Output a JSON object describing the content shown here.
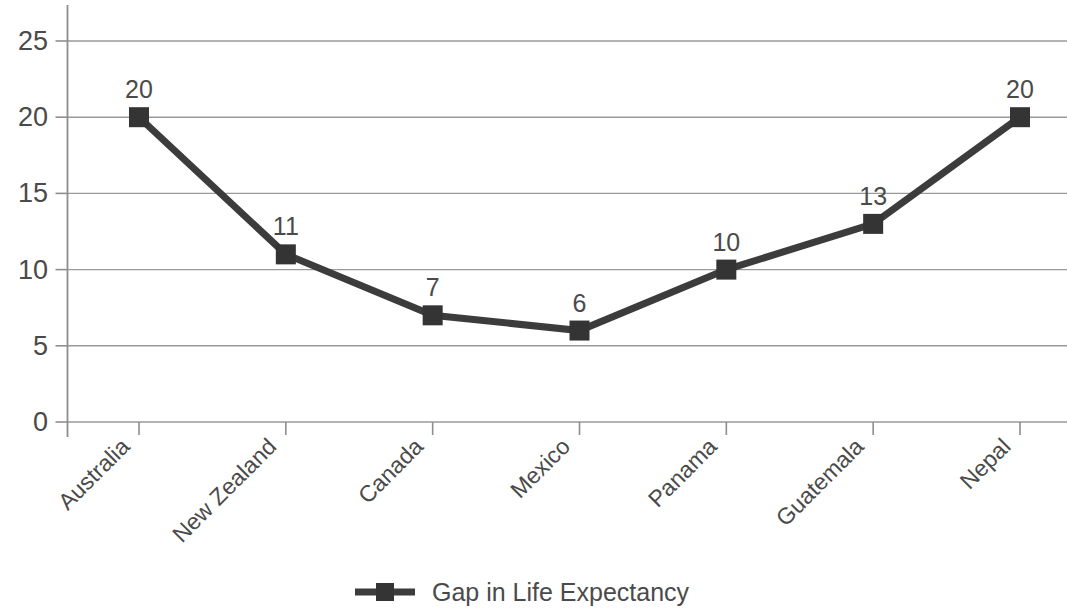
{
  "chart_data": {
    "type": "line",
    "title": "",
    "subtitle": "",
    "xlabel": "",
    "ylabel": "",
    "categories": [
      "Australia",
      "New Zealand",
      "Canada",
      "Mexico",
      "Panama",
      "Guatemala",
      "Nepal"
    ],
    "series": [
      {
        "name": "Gap in Life Expectancy",
        "values": [
          20,
          11,
          7,
          6,
          10,
          13,
          20
        ],
        "point_labels": [
          "20",
          "11",
          "7",
          "6",
          "10",
          "13",
          "20"
        ],
        "color": "#3c3c3c",
        "marker": "square"
      }
    ],
    "ylim": [
      0,
      25
    ],
    "ytick_labels": [
      "0",
      "5",
      "10",
      "15",
      "20",
      "25"
    ],
    "ytick_values": [
      0,
      5,
      10,
      15,
      20,
      25
    ],
    "grid": "horizontal",
    "legend_position": "bottom",
    "xtick_rotation_deg": 45
  },
  "legend": {
    "entries": [
      {
        "label": "Gap in Life Expectancy",
        "color": "#3c3c3c",
        "marker": "square"
      }
    ]
  },
  "colors": {
    "series": "#3c3c3c",
    "grid": "#9a9a9a",
    "axis": "#8e8e8e",
    "text": "#4a4a4a",
    "background": "#ffffff"
  }
}
